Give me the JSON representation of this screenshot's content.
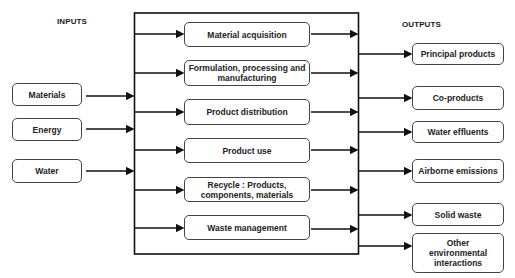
{
  "headers": {
    "inputs": "INPUTS",
    "outputs": "OUTPUTS"
  },
  "inputs": [
    {
      "label": "Materials"
    },
    {
      "label": "Energy"
    },
    {
      "label": "Water"
    }
  ],
  "stages": [
    {
      "label": "Material acquisition"
    },
    {
      "label": "Formulation, processing and manufacturing"
    },
    {
      "label": "Product distribution"
    },
    {
      "label": "Product use"
    },
    {
      "label": "Recycle : Products, components, materials"
    },
    {
      "label": "Waste management"
    }
  ],
  "outputs": [
    {
      "label": "Principal products"
    },
    {
      "label": "Co-products"
    },
    {
      "label": "Water effluents"
    },
    {
      "label": "Airborne emissions"
    },
    {
      "label": "Solid waste"
    },
    {
      "label": "Other environmental interactions"
    }
  ],
  "colors": {
    "line": "#111111",
    "box_border": "#444444",
    "background": "#ffffff"
  }
}
